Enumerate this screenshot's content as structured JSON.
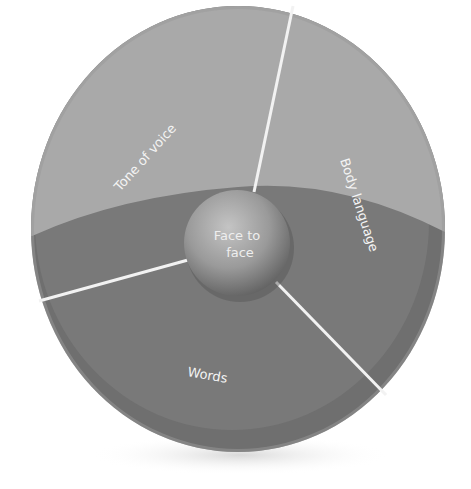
{
  "diagram": {
    "title": "",
    "center_label_line1": "Face to",
    "center_label_line2": "face",
    "segments": [
      {
        "id": "tone-of-voice",
        "label": "Tone of voice"
      },
      {
        "id": "body-language",
        "label": "Body language"
      },
      {
        "id": "words",
        "label": "Words"
      }
    ],
    "colors": {
      "background": "#ffffff",
      "upper_cap": "#a8a8a8",
      "lower_body": "#767676",
      "rim_dark": "#6a6a6a",
      "separator": "#f2f2f2",
      "sphere_light": "#bdbdbd",
      "sphere_dark": "#6c6c6c",
      "text": "#f4f4f4"
    }
  }
}
